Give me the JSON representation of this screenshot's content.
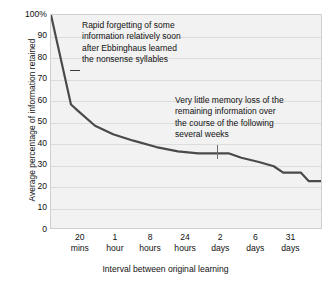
{
  "chart_data": {
    "type": "line",
    "title": "",
    "xlabel": "Interval between original learning",
    "ylabel": "Average percentage of information retained",
    "ylim": [
      0,
      100
    ],
    "grid": true,
    "legend": "none",
    "y_ticks": [
      "100%",
      "90",
      "80",
      "70",
      "60",
      "50",
      "40",
      "30",
      "20",
      "10",
      "0"
    ],
    "y_tick_values": [
      100,
      90,
      80,
      70,
      60,
      50,
      40,
      30,
      20,
      10,
      0
    ],
    "categories": [
      "20 mins",
      "1 hour",
      "8 hours",
      "24 hours",
      "2 days",
      "6 days",
      "31 days"
    ],
    "x_tick_labels": [
      {
        "top": "20",
        "bottom": "mins"
      },
      {
        "top": "1",
        "bottom": "hour"
      },
      {
        "top": "8",
        "bottom": "hours"
      },
      {
        "top": "24",
        "bottom": "hours"
      },
      {
        "top": "2",
        "bottom": "days"
      },
      {
        "top": "6",
        "bottom": "days"
      },
      {
        "top": "31",
        "bottom": "days"
      }
    ],
    "series": [
      {
        "name": "Retention",
        "points": [
          {
            "x": 0.0,
            "y": 100
          },
          {
            "x": 7.4,
            "y": 58
          },
          {
            "x": 10.0,
            "y": 55
          },
          {
            "x": 16.3,
            "y": 48
          },
          {
            "x": 23.0,
            "y": 44
          },
          {
            "x": 30.5,
            "y": 41
          },
          {
            "x": 39.0,
            "y": 38
          },
          {
            "x": 47.0,
            "y": 36
          },
          {
            "x": 54.5,
            "y": 35
          },
          {
            "x": 62.0,
            "y": 35
          },
          {
            "x": 66.0,
            "y": 35
          },
          {
            "x": 70.5,
            "y": 33
          },
          {
            "x": 77.0,
            "y": 31
          },
          {
            "x": 82.5,
            "y": 29
          },
          {
            "x": 86.0,
            "y": 26
          },
          {
            "x": 92.5,
            "y": 26
          },
          {
            "x": 95.5,
            "y": 22
          },
          {
            "x": 100.0,
            "y": 22
          }
        ]
      }
    ],
    "annotations": [
      {
        "id": "annotation-1",
        "text": "Rapid forgetting of some\ninformation relatively soon\nafter Ebbinghaus learned\nthe nonsense syllables",
        "leader": "horizontal-dash"
      },
      {
        "id": "annotation-2",
        "text": "Very little memory loss of the\nremaining information over\nthe course of the following\nseveral weeks",
        "leader": "vertical-line"
      }
    ],
    "colors": {
      "plot_background": "#f2f2f2",
      "gridline": "#dcdcdc",
      "curve": "#4a4a4a",
      "text": "#111111",
      "border": "#cfcfcf"
    }
  }
}
